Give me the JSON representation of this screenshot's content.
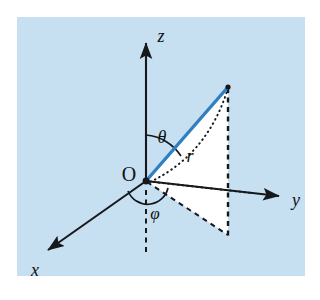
{
  "figure": {
    "panel": {
      "background_color": "#c6e0f2",
      "outer_background_color": "#ffffff",
      "x": 17,
      "y": 17,
      "width": 288,
      "height": 259
    },
    "colors": {
      "axis": "#16181c",
      "radial_vector": "#2f7fc1",
      "dashed": "#16181c",
      "dotted": "#16181c",
      "wedge_fill": "#ffffff",
      "label": "#111111"
    }
  },
  "origin": {
    "label": "O",
    "x": 146,
    "y": 181,
    "dot_radius": 3.4,
    "label_x": 129,
    "label_y": 176
  },
  "axes": [
    {
      "name": "z-axis",
      "label": "z",
      "from_x": 146,
      "from_y": 181,
      "to_x": 146,
      "to_y": 37,
      "label_x": 161,
      "label_y": 38,
      "style": "solid-arrow"
    },
    {
      "name": "y-axis",
      "label": "y",
      "from_x": 146,
      "from_y": 181,
      "to_x": 285,
      "to_y": 197,
      "label_x": 297,
      "label_y": 204,
      "style": "solid-arrow"
    },
    {
      "name": "x-axis",
      "label": "x",
      "from_x": 146,
      "from_y": 181,
      "to_x": 43,
      "to_y": 254,
      "label_x": 33,
      "label_y": 277,
      "style": "solid-arrow"
    },
    {
      "name": "negative-z-axis",
      "label": "",
      "from_x": 146,
      "from_y": 189,
      "to_x": 146,
      "to_y": 250,
      "label_x": 0,
      "label_y": 0,
      "style": "dashed"
    }
  ],
  "radial_vector": {
    "name": "radius-vector",
    "label": "r",
    "from_x": 146,
    "from_y": 181,
    "to_x": 228,
    "to_y": 87,
    "stroke_width": 3.4,
    "label_x": 189,
    "label_y": 162
  },
  "angles": [
    {
      "name": "theta",
      "label": "θ",
      "description": "polar angle from z-axis to radius vector",
      "label_x": 160,
      "label_y": 142,
      "arc_radius": 46
    },
    {
      "name": "phi",
      "label": "φ",
      "description": "azimuthal angle in the xy-plane",
      "label_x": 152,
      "label_y": 218,
      "arc_radius": 21
    }
  ],
  "construction_lines": [
    {
      "name": "vertical-drop-line",
      "style": "dashed",
      "from_x": 228,
      "from_y": 87,
      "to_x": 228,
      "to_y": 235
    },
    {
      "name": "projection-ray-dotted",
      "style": "dotted",
      "from_x": 146,
      "from_y": 181,
      "to_x": 251,
      "to_y": 193
    },
    {
      "name": "wedge-edge-lower",
      "style": "dashed",
      "from_x": 146,
      "from_y": 181,
      "to_x": 228,
      "to_y": 235
    },
    {
      "name": "meridian-arc-dotted",
      "style": "dotted-arc",
      "from_x": 228,
      "from_y": 87,
      "to_x": 163,
      "to_y": 190
    },
    {
      "name": "wedge-region",
      "style": "filled",
      "points": "146,181 228,235 228,87"
    }
  ]
}
